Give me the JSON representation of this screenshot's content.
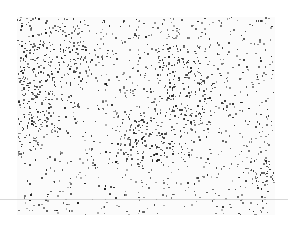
{
  "image": {
    "description": "Grayscale stippled microscopy-like texture of dark clustered dots on white background",
    "colors": {
      "background": "#ffffff",
      "dots_dark": "#1e1e1e",
      "dots_light": "#9a9a9a",
      "line": "#c8c8c8"
    },
    "frame": {
      "x": 17,
      "y": 17,
      "width": 258,
      "height": 198
    },
    "horizontal_line_y": 199,
    "dense_regions": [
      {
        "cx": 20,
        "cy": 40,
        "r": 25
      },
      {
        "cx": 5,
        "cy": 105,
        "r": 20
      },
      {
        "cx": 165,
        "cy": 55,
        "r": 18
      },
      {
        "cx": 172,
        "cy": 92,
        "r": 15
      },
      {
        "cx": 120,
        "cy": 115,
        "r": 14
      },
      {
        "cx": 140,
        "cy": 130,
        "r": 14
      },
      {
        "cx": 50,
        "cy": 40,
        "r": 15
      },
      {
        "cx": 245,
        "cy": 160,
        "r": 12
      }
    ]
  }
}
